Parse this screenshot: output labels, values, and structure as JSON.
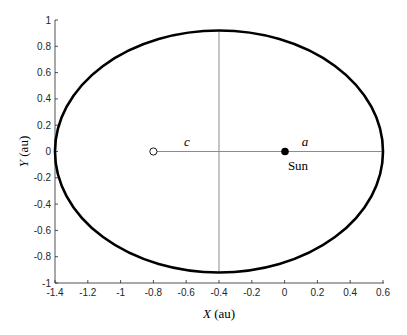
{
  "chart_data": {
    "type": "line",
    "title": "",
    "xlabel": "X (au)",
    "ylabel": "Y (au)",
    "xlabel_var": "X",
    "xlabel_unit": " (au)",
    "ylabel_var": "Y",
    "ylabel_unit": " (au)",
    "xlim": [
      -1.4,
      0.6
    ],
    "ylim": [
      -1,
      1
    ],
    "grid": false,
    "x_ticks": [
      "-1.4",
      "-1.2",
      "-1",
      "-0.8",
      "-0.6",
      "-0.4",
      "-0.2",
      "0",
      "0.2",
      "0.4",
      "0.6"
    ],
    "y_ticks": [
      "1",
      "0.8",
      "0.6",
      "0.4",
      "0.2",
      "0",
      "-0.2",
      "-0.4",
      "-0.6",
      "-0.8",
      "-1"
    ],
    "series": [
      {
        "name": "orbit ellipse",
        "shape": "ellipse",
        "center": [
          -0.4,
          0
        ],
        "semi_major_axis": 1.0,
        "semi_minor_axis": 0.92,
        "color": "#000000"
      },
      {
        "name": "major axis line",
        "x": [
          -0.8,
          0.6
        ],
        "y": [
          0,
          0
        ],
        "color": "#808080"
      },
      {
        "name": "minor axis line",
        "x": [
          -0.4,
          -0.4
        ],
        "y": [
          -0.92,
          0.92
        ],
        "color": "#808080"
      }
    ],
    "points": [
      {
        "name": "Sun",
        "x": 0,
        "y": 0,
        "marker": "filled-circle"
      },
      {
        "name": "empty focus",
        "x": -0.8,
        "y": 0,
        "marker": "open-circle"
      }
    ],
    "annotations": [
      {
        "text": "c",
        "x": -0.6,
        "y": 0.09,
        "italic": true
      },
      {
        "text": "a",
        "x": 0.1,
        "y": 0.09,
        "italic": true
      },
      {
        "text": "Sun",
        "x": 0.05,
        "y": -0.1,
        "italic": false
      }
    ]
  }
}
